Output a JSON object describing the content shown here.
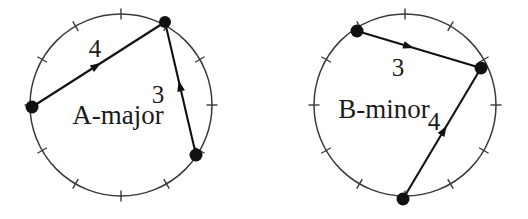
{
  "figure": {
    "background_color": "#ffffff",
    "stroke_color": "#3a3a3a",
    "chord_color": "#111111",
    "vertex_color": "#111111",
    "text_color": "#1a1a1a",
    "tick_count": 12
  },
  "diagrams": [
    {
      "id": "left-diagram",
      "label": "A-major",
      "label_x": 118,
      "label_y": 124,
      "circle": {
        "cx": 121,
        "cy": 105,
        "r": 91
      },
      "vertices": [
        {
          "name": "root-vertex",
          "x": 32,
          "y": 107,
          "r": 6.5
        },
        {
          "name": "top-vertex",
          "x": 165,
          "y": 22,
          "r": 6.0
        },
        {
          "name": "lower-right-vertex",
          "x": 196,
          "y": 155,
          "r": 6.5
        }
      ],
      "chords": [
        {
          "name": "interval-chord-4",
          "value": "4",
          "from": {
            "x": 32,
            "y": 107
          },
          "to": {
            "x": 165,
            "y": 22
          },
          "arrow_t": 0.52,
          "label_x": 95,
          "label_y": 57
        },
        {
          "name": "interval-chord-3",
          "value": "3",
          "from": {
            "x": 196,
            "y": 155
          },
          "to": {
            "x": 165,
            "y": 22
          },
          "arrow_t": 0.56,
          "label_x": 158,
          "label_y": 103
        }
      ]
    },
    {
      "id": "right-diagram",
      "label": "B-minor",
      "label_x": 384,
      "label_y": 118,
      "circle": {
        "cx": 405,
        "cy": 105,
        "r": 91
      },
      "vertices": [
        {
          "name": "root-vertex",
          "x": 357,
          "y": 31,
          "r": 6.5
        },
        {
          "name": "right-vertex",
          "x": 481,
          "y": 68,
          "r": 6.5
        },
        {
          "name": "bottom-vertex",
          "x": 403,
          "y": 199,
          "r": 6.5
        }
      ],
      "chords": [
        {
          "name": "interval-chord-3",
          "value": "3",
          "from": {
            "x": 357,
            "y": 31
          },
          "to": {
            "x": 481,
            "y": 68
          },
          "arrow_t": 0.46,
          "label_x": 398,
          "label_y": 76
        },
        {
          "name": "interval-chord-4",
          "value": "4",
          "from": {
            "x": 403,
            "y": 199
          },
          "to": {
            "x": 481,
            "y": 68
          },
          "arrow_t": 0.56,
          "label_x": 434,
          "label_y": 130
        }
      ]
    }
  ]
}
